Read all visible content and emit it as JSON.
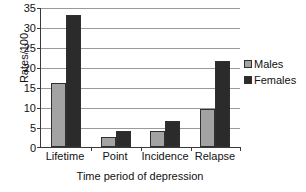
{
  "chart_data": {
    "type": "bar",
    "title": "",
    "xlabel": "Time period of depression",
    "ylabel": "Rates/100",
    "categories": [
      "Lifetime",
      "Point",
      "Incidence",
      "Relapse"
    ],
    "series": [
      {
        "name": "Males",
        "color": "#a3a3a3",
        "values": [
          16,
          2.5,
          4,
          9.5
        ]
      },
      {
        "name": "Females",
        "color": "#2b2b2b",
        "values": [
          33,
          3.9,
          6.5,
          21.5
        ]
      }
    ],
    "ylim": [
      0,
      35
    ],
    "ytick_step": 5,
    "yticks": [
      "0",
      "5",
      "10",
      "15",
      "20",
      "25",
      "30",
      "35"
    ],
    "grid": "horizontal",
    "legend_position": "right"
  }
}
